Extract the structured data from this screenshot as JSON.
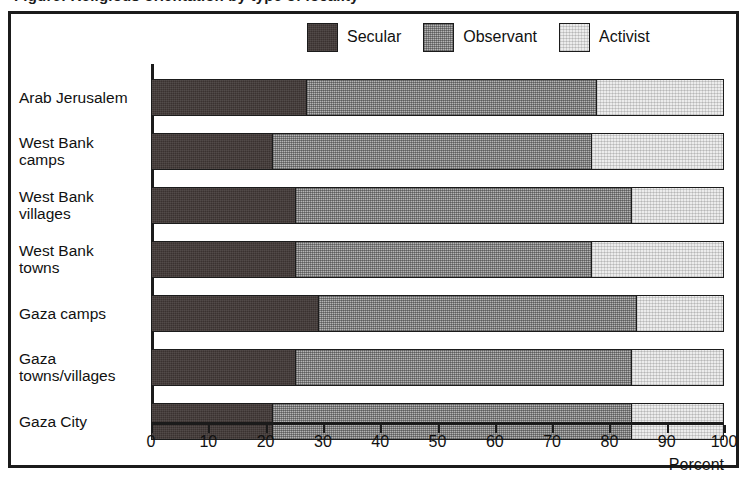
{
  "title": "Figure: Religious orientation by type of locality",
  "legend": {
    "position": "top-right",
    "items": [
      {
        "label": "Secular",
        "key": "secular",
        "color": "#3a3230",
        "icon": "legend-swatch-icon"
      },
      {
        "label": "Observant",
        "key": "observant",
        "color": "#b4b4b4",
        "icon": "legend-swatch-icon"
      },
      {
        "label": "Activist",
        "key": "activist",
        "color": "#ececec",
        "icon": "legend-swatch-icon"
      }
    ]
  },
  "axis": {
    "xlabel": "Percent",
    "ticks": [
      {
        "value": 0,
        "label": "0"
      },
      {
        "value": 10,
        "label": "10"
      },
      {
        "value": 20,
        "label": "20"
      },
      {
        "value": 30,
        "label": "30"
      },
      {
        "value": 40,
        "label": "40"
      },
      {
        "value": 50,
        "label": "50"
      },
      {
        "value": 60,
        "label": "60"
      },
      {
        "value": 70,
        "label": "70"
      },
      {
        "value": 80,
        "label": "80"
      },
      {
        "value": 90,
        "label": "90"
      },
      {
        "value": 100,
        "label": "100"
      }
    ]
  },
  "chart_data": {
    "type": "bar",
    "orientation": "horizontal",
    "stacked": true,
    "title": "Figure: Religious orientation by type of locality",
    "xlabel": "Percent",
    "ylabel": "",
    "xlim": [
      0,
      100
    ],
    "grid": false,
    "legend_position": "top-right",
    "categories": [
      "Arab Jerusalem",
      "West Bank camps",
      "West Bank villages",
      "West Bank towns",
      "Gaza camps",
      "Gaza towns/villages",
      "Gaza City"
    ],
    "category_lines": [
      [
        "Arab Jerusalem"
      ],
      [
        "West Bank",
        "camps"
      ],
      [
        "West Bank",
        "villages"
      ],
      [
        "West Bank",
        "towns"
      ],
      [
        "Gaza camps"
      ],
      [
        "Gaza",
        "towns/villages"
      ],
      [
        "Gaza City"
      ]
    ],
    "series": [
      {
        "name": "Secular",
        "color": "#3a3230",
        "values": [
          27,
          21,
          25,
          25,
          29,
          25,
          21
        ]
      },
      {
        "name": "Observant",
        "color": "#b4b4b4",
        "values": [
          51,
          56,
          59,
          52,
          56,
          59,
          63
        ]
      },
      {
        "name": "Activist",
        "color": "#ececec",
        "values": [
          22,
          23,
          16,
          23,
          15,
          16,
          16
        ]
      }
    ],
    "cumulative_boundaries": [
      [
        27,
        78
      ],
      [
        21,
        77
      ],
      [
        25,
        84
      ],
      [
        25,
        77
      ],
      [
        29,
        85
      ],
      [
        25,
        84
      ],
      [
        21,
        84
      ]
    ]
  }
}
